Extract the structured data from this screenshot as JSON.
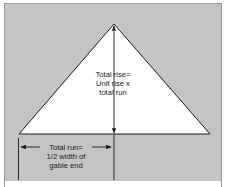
{
  "diagram": {
    "type": "roof-gable-measurement",
    "background_color": "#c4c4c4",
    "triangle_color": "#ffffff",
    "line_color": "#1a1a1a",
    "rise_label": {
      "line1": "Total rise=",
      "line2": "Unit rise x",
      "line3": "total run"
    },
    "run_label": {
      "line1": "Total run=",
      "line2": "1/2 width of",
      "line3": "gable end"
    }
  }
}
